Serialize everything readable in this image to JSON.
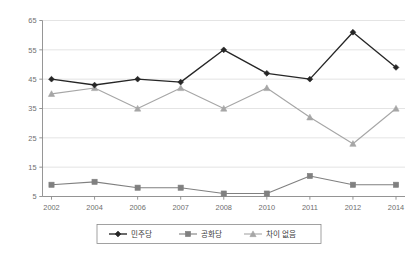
{
  "chart_data": {
    "type": "line",
    "title": "",
    "subtitle": "",
    "xlabel": "",
    "ylabel": "",
    "categories": [
      "2002",
      "2004",
      "2006",
      "2007",
      "2008",
      "2010",
      "2011",
      "2012",
      "2014"
    ],
    "ylim": [
      5,
      65
    ],
    "yticks": [
      5,
      15,
      25,
      35,
      45,
      55,
      65
    ],
    "ytick_labels": [
      "5",
      "15",
      "25",
      "35",
      "45",
      "55",
      "65"
    ],
    "grid": true,
    "legend_position": "bottom",
    "series": [
      {
        "name": "민주당",
        "marker": "diamond",
        "color": "#262626",
        "values": [
          45,
          43,
          45,
          44,
          55,
          47,
          45,
          61,
          49
        ]
      },
      {
        "name": "공화당",
        "marker": "square",
        "color": "#808080",
        "values": [
          9,
          10,
          8,
          8,
          6,
          6,
          12,
          9,
          9
        ]
      },
      {
        "name": "차이 없음",
        "marker": "triangle",
        "color": "#a6a6a6",
        "values": [
          40,
          42,
          35,
          42,
          35,
          42,
          32,
          23,
          35
        ]
      }
    ]
  },
  "legend": {
    "items": [
      {
        "label": "민주당"
      },
      {
        "label": "공화당"
      },
      {
        "label": "차이 없음"
      }
    ]
  },
  "axes": {
    "y_tick_labels": [
      "65",
      "55",
      "45",
      "35",
      "25",
      "15",
      "5"
    ],
    "x_tick_labels": [
      "2002",
      "2004",
      "2006",
      "2007",
      "2008",
      "2010",
      "2011",
      "2012",
      "2014"
    ]
  }
}
